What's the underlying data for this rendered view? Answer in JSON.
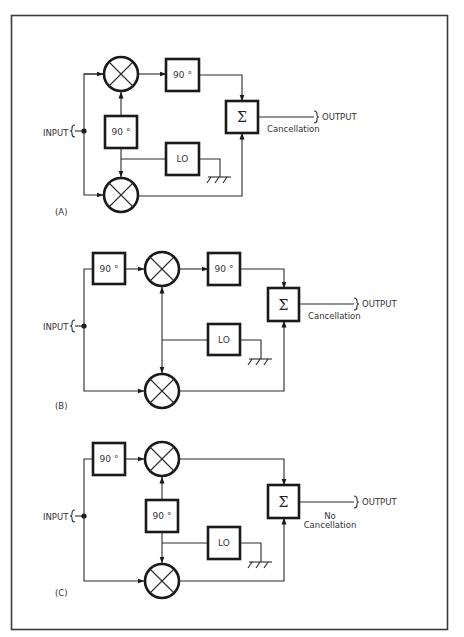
{
  "figure": {
    "frame_color": "#3a3a3a",
    "stroke_color": "#1a1a1a",
    "background": "#ffffff"
  },
  "panels": [
    {
      "id": "A",
      "label": "(A)",
      "input_label": "INPUT",
      "output_label": "OUTPUT",
      "result_line1": "",
      "result_line2": "Cancellation",
      "blocks": {
        "phase_mid": "90 °",
        "phase_out": "90 °",
        "lo": "LO",
        "sum": "Σ"
      }
    },
    {
      "id": "B",
      "label": "(B)",
      "input_label": "INPUT",
      "output_label": "OUTPUT",
      "result_line1": "",
      "result_line2": "Cancellation",
      "blocks": {
        "phase_in": "90 °",
        "phase_out": "90 °",
        "lo": "LO",
        "sum": "Σ"
      }
    },
    {
      "id": "C",
      "label": "(C)",
      "input_label": "INPUT",
      "output_label": "OUTPUT",
      "result_line1": "No",
      "result_line2": "Cancellation",
      "blocks": {
        "phase_in": "90 °",
        "phase_mid": "90 °",
        "lo": "LO",
        "sum": "Σ"
      }
    }
  ]
}
